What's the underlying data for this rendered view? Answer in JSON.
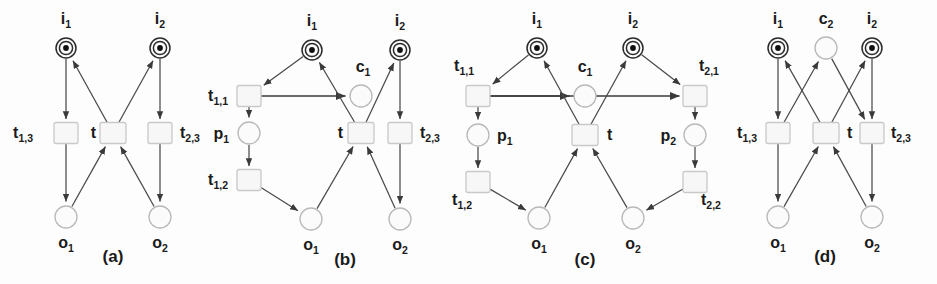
{
  "figure": {
    "background": "#fdfdfd",
    "stroke_color": "#4a4a4a",
    "text_color": "#1a1a1a",
    "place_fill": "#fbfbfb",
    "transition_fill": "#f7f7f7",
    "token_color": "#111111"
  },
  "panels": [
    {
      "id": "a",
      "caption": "(a)",
      "caption_pos": {
        "x": 113,
        "y": 262
      },
      "places": [
        {
          "name": "i1",
          "label": "i",
          "sub": "1",
          "x": 66,
          "y": 48,
          "r": 10,
          "token": true,
          "label_pos": {
            "x": 66,
            "y": 24
          }
        },
        {
          "name": "i2",
          "label": "i",
          "sub": "2",
          "x": 160,
          "y": 48,
          "r": 10,
          "token": true,
          "label_pos": {
            "x": 160,
            "y": 24
          }
        },
        {
          "name": "o1",
          "label": "o",
          "sub": "1",
          "x": 66,
          "y": 217,
          "r": 11,
          "token": false,
          "label_pos": {
            "x": 66,
            "y": 248
          }
        },
        {
          "name": "o2",
          "label": "o",
          "sub": "2",
          "x": 160,
          "y": 217,
          "r": 11,
          "token": false,
          "label_pos": {
            "x": 160,
            "y": 248
          }
        }
      ],
      "transitions": [
        {
          "name": "t13",
          "label": "t",
          "sub": "1,3",
          "x": 66,
          "y": 133,
          "w": 24,
          "h": 21,
          "label_pos": {
            "x": 33,
            "y": 138
          },
          "anchor": "end"
        },
        {
          "name": "t",
          "label": "t",
          "sub": "",
          "x": 113,
          "y": 133,
          "w": 26,
          "h": 21,
          "label_pos": {
            "x": 96,
            "y": 138
          },
          "anchor": "end"
        },
        {
          "name": "t23",
          "label": "t",
          "sub": "2,3",
          "x": 160,
          "y": 133,
          "w": 24,
          "h": 21,
          "label_pos": {
            "x": 180,
            "y": 138
          },
          "anchor": "start"
        }
      ]
    },
    {
      "id": "b",
      "caption": "(b)",
      "caption_pos": {
        "x": 345,
        "y": 265
      },
      "places": [
        {
          "name": "i1",
          "label": "i",
          "sub": "1",
          "x": 312,
          "y": 50,
          "r": 10,
          "token": true,
          "label_pos": {
            "x": 312,
            "y": 26
          }
        },
        {
          "name": "i2",
          "label": "i",
          "sub": "2",
          "x": 400,
          "y": 50,
          "r": 10,
          "token": true,
          "label_pos": {
            "x": 400,
            "y": 26
          }
        },
        {
          "name": "c1",
          "label": "c",
          "sub": "1",
          "x": 361,
          "y": 96,
          "r": 11,
          "token": false,
          "label_pos": {
            "x": 363,
            "y": 72
          }
        },
        {
          "name": "p1",
          "label": "p",
          "sub": "1",
          "x": 249,
          "y": 133,
          "r": 11,
          "token": false,
          "label_pos": {
            "x": 229,
            "y": 139
          },
          "anchor": "end"
        },
        {
          "name": "o1",
          "label": "o",
          "sub": "1",
          "x": 311,
          "y": 219,
          "r": 11,
          "token": false,
          "label_pos": {
            "x": 311,
            "y": 250
          }
        },
        {
          "name": "o2",
          "label": "o",
          "sub": "2",
          "x": 400,
          "y": 219,
          "r": 11,
          "token": false,
          "label_pos": {
            "x": 400,
            "y": 250
          }
        }
      ],
      "transitions": [
        {
          "name": "t11",
          "label": "t",
          "sub": "1,1",
          "x": 249,
          "y": 96,
          "w": 24,
          "h": 21,
          "label_pos": {
            "x": 228,
            "y": 101
          },
          "anchor": "end"
        },
        {
          "name": "t12",
          "label": "t",
          "sub": "1,2",
          "x": 249,
          "y": 180,
          "w": 24,
          "h": 21,
          "label_pos": {
            "x": 228,
            "y": 185
          },
          "anchor": "end"
        },
        {
          "name": "t",
          "label": "t",
          "sub": "",
          "x": 361,
          "y": 133,
          "w": 26,
          "h": 21,
          "label_pos": {
            "x": 343,
            "y": 138
          },
          "anchor": "end"
        },
        {
          "name": "t23",
          "label": "t",
          "sub": "2,3",
          "x": 400,
          "y": 133,
          "w": 24,
          "h": 21,
          "label_pos": {
            "x": 420,
            "y": 138
          },
          "anchor": "start"
        }
      ]
    },
    {
      "id": "c",
      "caption": "(c)",
      "caption_pos": {
        "x": 585,
        "y": 265
      },
      "places": [
        {
          "name": "i1",
          "label": "i",
          "sub": "1",
          "x": 537,
          "y": 48,
          "r": 10,
          "token": true,
          "label_pos": {
            "x": 537,
            "y": 24
          }
        },
        {
          "name": "i2",
          "label": "i",
          "sub": "2",
          "x": 633,
          "y": 48,
          "r": 10,
          "token": true,
          "label_pos": {
            "x": 633,
            "y": 24
          }
        },
        {
          "name": "c1",
          "label": "c",
          "sub": "1",
          "x": 585,
          "y": 96,
          "r": 11,
          "token": false,
          "label_pos": {
            "x": 585,
            "y": 72
          }
        },
        {
          "name": "p1",
          "label": "p",
          "sub": "1",
          "x": 478,
          "y": 135,
          "r": 11,
          "token": false,
          "label_pos": {
            "x": 497,
            "y": 141
          },
          "anchor": "start"
        },
        {
          "name": "p2",
          "label": "p",
          "sub": "2",
          "x": 695,
          "y": 135,
          "r": 11,
          "token": false,
          "label_pos": {
            "x": 676,
            "y": 141
          },
          "anchor": "end"
        },
        {
          "name": "o1",
          "label": "o",
          "sub": "1",
          "x": 539,
          "y": 218,
          "r": 11,
          "token": false,
          "label_pos": {
            "x": 539,
            "y": 249
          }
        },
        {
          "name": "o2",
          "label": "o",
          "sub": "2",
          "x": 633,
          "y": 218,
          "r": 11,
          "token": false,
          "label_pos": {
            "x": 633,
            "y": 249
          }
        }
      ],
      "transitions": [
        {
          "name": "t11",
          "label": "t",
          "sub": "1,1",
          "x": 478,
          "y": 96,
          "w": 24,
          "h": 21,
          "label_pos": {
            "x": 474,
            "y": 71
          },
          "anchor": "end"
        },
        {
          "name": "t12",
          "label": "t",
          "sub": "1,2",
          "x": 478,
          "y": 182,
          "w": 24,
          "h": 21,
          "label_pos": {
            "x": 472,
            "y": 205
          },
          "anchor": "end"
        },
        {
          "name": "t21",
          "label": "t",
          "sub": "2,1",
          "x": 695,
          "y": 96,
          "w": 24,
          "h": 21,
          "label_pos": {
            "x": 699,
            "y": 71
          },
          "anchor": "start"
        },
        {
          "name": "t22",
          "label": "t",
          "sub": "2,2",
          "x": 695,
          "y": 182,
          "w": 24,
          "h": 21,
          "label_pos": {
            "x": 701,
            "y": 205
          },
          "anchor": "start"
        },
        {
          "name": "t",
          "label": "t",
          "sub": "",
          "x": 585,
          "y": 135,
          "w": 26,
          "h": 21,
          "label_pos": {
            "x": 607,
            "y": 140
          },
          "anchor": "start"
        }
      ]
    },
    {
      "id": "d",
      "caption": "(d)",
      "caption_pos": {
        "x": 825,
        "y": 262
      },
      "places": [
        {
          "name": "i1",
          "label": "i",
          "sub": "1",
          "x": 778,
          "y": 48,
          "r": 10,
          "token": true,
          "label_pos": {
            "x": 778,
            "y": 24
          }
        },
        {
          "name": "c2",
          "label": "c",
          "sub": "2",
          "x": 826,
          "y": 48,
          "r": 11,
          "token": false,
          "label_pos": {
            "x": 826,
            "y": 24
          }
        },
        {
          "name": "i2",
          "label": "i",
          "sub": "2",
          "x": 872,
          "y": 48,
          "r": 10,
          "token": true,
          "label_pos": {
            "x": 872,
            "y": 24
          }
        },
        {
          "name": "o1",
          "label": "o",
          "sub": "1",
          "x": 778,
          "y": 217,
          "r": 11,
          "token": false,
          "label_pos": {
            "x": 778,
            "y": 248
          }
        },
        {
          "name": "o2",
          "label": "o",
          "sub": "2",
          "x": 872,
          "y": 217,
          "r": 11,
          "token": false,
          "label_pos": {
            "x": 872,
            "y": 248
          }
        }
      ],
      "transitions": [
        {
          "name": "t13",
          "label": "t",
          "sub": "1,3",
          "x": 778,
          "y": 133,
          "w": 24,
          "h": 21,
          "label_pos": {
            "x": 757,
            "y": 138
          },
          "anchor": "end"
        },
        {
          "name": "t",
          "label": "t",
          "sub": "",
          "x": 826,
          "y": 133,
          "w": 26,
          "h": 21,
          "label_pos": {
            "x": 847,
            "y": 138
          },
          "anchor": "start"
        },
        {
          "name": "t23",
          "label": "t",
          "sub": "2,3",
          "x": 872,
          "y": 133,
          "w": 24,
          "h": 21,
          "label_pos": {
            "x": 891,
            "y": 138
          },
          "anchor": "start"
        }
      ]
    }
  ]
}
